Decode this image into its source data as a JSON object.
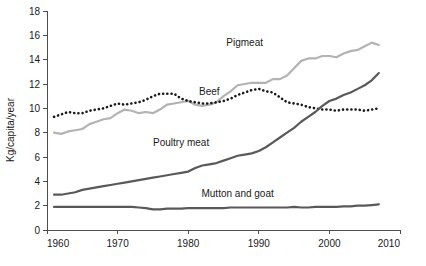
{
  "chart_data": {
    "type": "line",
    "title": "",
    "xlabel": "",
    "ylabel": "Kg/capita/year",
    "xlim": [
      1960,
      2010
    ],
    "ylim": [
      0,
      18
    ],
    "ytick_step": 2,
    "xtick_step": 10,
    "grid": false,
    "legend_position": "inline-labels",
    "xticks": [
      "1960",
      "1970",
      "1980",
      "1990",
      "2000",
      "2010"
    ],
    "yticks": [
      "0",
      "2",
      "4",
      "6",
      "8",
      "10",
      "12",
      "14",
      "16",
      "18"
    ],
    "x": [
      1961,
      1962,
      1963,
      1964,
      1965,
      1966,
      1967,
      1968,
      1969,
      1970,
      1971,
      1972,
      1973,
      1974,
      1975,
      1976,
      1977,
      1978,
      1979,
      1980,
      1981,
      1982,
      1983,
      1984,
      1985,
      1986,
      1987,
      1988,
      1989,
      1990,
      1991,
      1992,
      1993,
      1994,
      1995,
      1996,
      1997,
      1998,
      1999,
      2000,
      2001,
      2002,
      2003,
      2004,
      2005,
      2006,
      2007
    ],
    "series": [
      {
        "name": "Pigmeat",
        "label": "Pigmeat",
        "color": "#b3b3b3",
        "style": "solid",
        "label_x": 1988,
        "label_y": 15.1,
        "values": [
          8.0,
          7.9,
          8.1,
          8.2,
          8.3,
          8.7,
          8.9,
          9.1,
          9.2,
          9.6,
          9.9,
          9.8,
          9.6,
          9.7,
          9.6,
          9.9,
          10.3,
          10.4,
          10.5,
          10.6,
          10.3,
          10.2,
          10.3,
          10.5,
          11.0,
          11.4,
          11.9,
          12.0,
          12.1,
          12.1,
          12.1,
          12.4,
          12.4,
          12.7,
          13.3,
          13.9,
          14.1,
          14.1,
          14.3,
          14.3,
          14.2,
          14.5,
          14.7,
          14.8,
          15.1,
          15.4,
          15.2
        ]
      },
      {
        "name": "Beef",
        "label": "Beef",
        "color": "#1a1a1a",
        "style": "dotted",
        "label_x": 1983,
        "label_y": 11.1,
        "values": [
          9.3,
          9.5,
          9.7,
          9.6,
          9.6,
          9.8,
          9.9,
          10.0,
          10.2,
          10.4,
          10.3,
          10.4,
          10.5,
          10.7,
          11.0,
          11.2,
          11.2,
          11.2,
          10.8,
          10.6,
          10.5,
          10.4,
          10.4,
          10.5,
          10.6,
          10.8,
          11.1,
          11.3,
          11.5,
          11.6,
          11.4,
          11.3,
          10.9,
          10.5,
          10.4,
          10.3,
          10.1,
          10.0,
          9.9,
          9.9,
          9.8,
          9.9,
          9.9,
          9.9,
          9.8,
          9.9,
          10.0
        ]
      },
      {
        "name": "Poultry meat",
        "label": "Poultry meat",
        "color": "#595959",
        "style": "solid",
        "label_x": 1979,
        "label_y": 6.9,
        "values": [
          2.9,
          2.9,
          3.0,
          3.1,
          3.3,
          3.4,
          3.5,
          3.6,
          3.7,
          3.8,
          3.9,
          4.0,
          4.1,
          4.2,
          4.3,
          4.4,
          4.5,
          4.6,
          4.7,
          4.8,
          5.1,
          5.3,
          5.4,
          5.5,
          5.7,
          5.9,
          6.1,
          6.2,
          6.3,
          6.5,
          6.8,
          7.2,
          7.6,
          8.0,
          8.4,
          8.9,
          9.3,
          9.7,
          10.2,
          10.6,
          10.8,
          11.1,
          11.3,
          11.6,
          11.9,
          12.3,
          12.9
        ]
      },
      {
        "name": "Mutton and goat",
        "label": "Mutton and goat",
        "color": "#595959",
        "style": "solid",
        "label_x": 1987,
        "label_y": 2.7,
        "values": [
          1.9,
          1.9,
          1.9,
          1.9,
          1.9,
          1.9,
          1.9,
          1.9,
          1.9,
          1.9,
          1.9,
          1.9,
          1.85,
          1.8,
          1.7,
          1.7,
          1.75,
          1.75,
          1.75,
          1.8,
          1.8,
          1.8,
          1.8,
          1.8,
          1.8,
          1.85,
          1.85,
          1.85,
          1.85,
          1.85,
          1.85,
          1.85,
          1.85,
          1.85,
          1.9,
          1.85,
          1.85,
          1.9,
          1.9,
          1.9,
          1.9,
          1.95,
          1.95,
          2.0,
          2.0,
          2.05,
          2.1
        ]
      }
    ]
  },
  "axes": {
    "y_axis_title": "Kg/capita/year"
  }
}
